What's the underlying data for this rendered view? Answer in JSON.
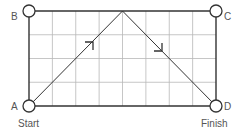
{
  "diagram": {
    "grid": {
      "columns": 8,
      "rows": 4
    },
    "corners": {
      "A": {
        "label": "A",
        "caption": "Start"
      },
      "B": {
        "label": "B"
      },
      "C": {
        "label": "C"
      },
      "D": {
        "label": "D",
        "caption": "Finish"
      }
    },
    "path": {
      "description": "Ball path from A up to top edge midpoint, then down to D",
      "points_grid": [
        [
          0,
          0
        ],
        [
          4,
          4
        ],
        [
          8,
          0
        ]
      ],
      "arrows": [
        "up-right",
        "down-right"
      ]
    },
    "colors": {
      "frame": "#333333",
      "grid": "#b8b8b8",
      "path": "#333333",
      "text": "#555555"
    }
  }
}
